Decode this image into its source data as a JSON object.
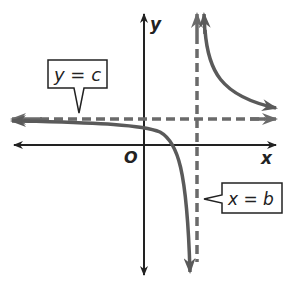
{
  "diagram": {
    "type": "rational-function-graph",
    "axes": {
      "x_label": "x",
      "y_label": "y",
      "origin_label": "O"
    },
    "asymptotes": [
      {
        "kind": "horizontal",
        "label": "y = c"
      },
      {
        "kind": "vertical",
        "label": "x = b"
      }
    ],
    "colors": {
      "curve": "#5a5a5a",
      "asymptote": "#6a6a6a",
      "axis": "#222222",
      "label_border": "#222222"
    }
  }
}
